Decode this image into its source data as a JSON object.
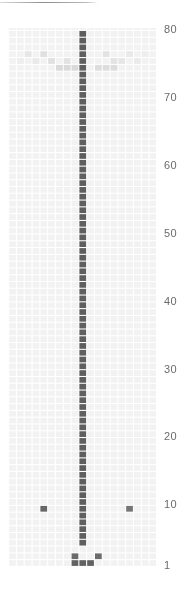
{
  "figure": {
    "top_rule_present": true,
    "background_color": "#ffffff",
    "grid_color": "#f2f2f2",
    "cell_dark_color": "#5f5f5f",
    "cell_mid_color": "#a8a8a8",
    "cell_light_color": "#dcdcdc",
    "axis_label_color": "#6b6b6b"
  },
  "axis": {
    "position": "right",
    "ticks": [
      {
        "label": "80",
        "value": 80,
        "y": 30
      },
      {
        "label": "70",
        "value": 70,
        "y": 98
      },
      {
        "label": "60",
        "value": 60,
        "y": 166
      },
      {
        "label": "50",
        "value": 50,
        "y": 234
      },
      {
        "label": "40",
        "value": 40,
        "y": 302
      },
      {
        "label": "30",
        "value": 30,
        "y": 370
      },
      {
        "label": "20",
        "value": 20,
        "y": 437
      },
      {
        "label": "10",
        "value": 10,
        "y": 505
      },
      {
        "label": "1",
        "value": 1,
        "y": 566
      }
    ]
  },
  "chart_data": {
    "type": "heatmap",
    "title": "",
    "xlabel": "",
    "ylabel": "",
    "grid": true,
    "legend_position": "none",
    "ylim": [
      1,
      80
    ],
    "xlim": [
      0,
      19
    ],
    "x": [
      0,
      1,
      2,
      3,
      4,
      5,
      6,
      7,
      8,
      9,
      10,
      11,
      12,
      13,
      14,
      15,
      16,
      17,
      18
    ],
    "y_ticks": [
      1,
      10,
      20,
      30,
      40,
      50,
      60,
      70,
      80
    ],
    "cell_width": 7.8,
    "cell_height": 6.8,
    "value_scale": {
      "0": "#ffffff",
      "0.25": "#dcdcdc",
      "0.5": "#a8a8a8",
      "1": "#5f5f5f"
    },
    "cells": [
      {
        "col": 9,
        "row": 79,
        "v": 1.0
      },
      {
        "col": 9,
        "row": 78,
        "v": 1.0
      },
      {
        "col": 9,
        "row": 77,
        "v": 1.0
      },
      {
        "col": 9,
        "row": 76,
        "v": 1.0
      },
      {
        "col": 9,
        "row": 75,
        "v": 1.0
      },
      {
        "col": 9,
        "row": 74,
        "v": 1.0
      },
      {
        "col": 9,
        "row": 73,
        "v": 1.0
      },
      {
        "col": 9,
        "row": 72,
        "v": 1.0
      },
      {
        "col": 9,
        "row": 71,
        "v": 1.0
      },
      {
        "col": 9,
        "row": 70,
        "v": 1.0
      },
      {
        "col": 9,
        "row": 69,
        "v": 1.0
      },
      {
        "col": 9,
        "row": 68,
        "v": 1.0
      },
      {
        "col": 9,
        "row": 67,
        "v": 1.0
      },
      {
        "col": 9,
        "row": 66,
        "v": 1.0
      },
      {
        "col": 9,
        "row": 65,
        "v": 1.0
      },
      {
        "col": 9,
        "row": 64,
        "v": 1.0
      },
      {
        "col": 9,
        "row": 63,
        "v": 1.0
      },
      {
        "col": 9,
        "row": 62,
        "v": 1.0
      },
      {
        "col": 9,
        "row": 61,
        "v": 1.0
      },
      {
        "col": 9,
        "row": 60,
        "v": 1.0
      },
      {
        "col": 9,
        "row": 59,
        "v": 1.0
      },
      {
        "col": 9,
        "row": 58,
        "v": 1.0
      },
      {
        "col": 9,
        "row": 57,
        "v": 1.0
      },
      {
        "col": 9,
        "row": 56,
        "v": 1.0
      },
      {
        "col": 9,
        "row": 55,
        "v": 1.0
      },
      {
        "col": 9,
        "row": 54,
        "v": 1.0
      },
      {
        "col": 9,
        "row": 53,
        "v": 1.0
      },
      {
        "col": 9,
        "row": 52,
        "v": 1.0
      },
      {
        "col": 9,
        "row": 51,
        "v": 1.0
      },
      {
        "col": 9,
        "row": 50,
        "v": 1.0
      },
      {
        "col": 9,
        "row": 49,
        "v": 1.0
      },
      {
        "col": 9,
        "row": 48,
        "v": 1.0
      },
      {
        "col": 9,
        "row": 47,
        "v": 1.0
      },
      {
        "col": 9,
        "row": 46,
        "v": 1.0
      },
      {
        "col": 9,
        "row": 45,
        "v": 1.0
      },
      {
        "col": 9,
        "row": 44,
        "v": 1.0
      },
      {
        "col": 9,
        "row": 43,
        "v": 1.0
      },
      {
        "col": 9,
        "row": 42,
        "v": 1.0
      },
      {
        "col": 9,
        "row": 41,
        "v": 1.0
      },
      {
        "col": 9,
        "row": 40,
        "v": 1.0
      },
      {
        "col": 9,
        "row": 39,
        "v": 1.0
      },
      {
        "col": 9,
        "row": 38,
        "v": 1.0
      },
      {
        "col": 9,
        "row": 37,
        "v": 1.0
      },
      {
        "col": 9,
        "row": 36,
        "v": 1.0
      },
      {
        "col": 9,
        "row": 35,
        "v": 1.0
      },
      {
        "col": 9,
        "row": 34,
        "v": 1.0
      },
      {
        "col": 9,
        "row": 33,
        "v": 1.0
      },
      {
        "col": 9,
        "row": 32,
        "v": 1.0
      },
      {
        "col": 9,
        "row": 31,
        "v": 1.0
      },
      {
        "col": 9,
        "row": 30,
        "v": 1.0
      },
      {
        "col": 9,
        "row": 29,
        "v": 1.0
      },
      {
        "col": 9,
        "row": 28,
        "v": 1.0
      },
      {
        "col": 9,
        "row": 27,
        "v": 1.0
      },
      {
        "col": 9,
        "row": 26,
        "v": 1.0
      },
      {
        "col": 9,
        "row": 25,
        "v": 1.0
      },
      {
        "col": 9,
        "row": 24,
        "v": 1.0
      },
      {
        "col": 9,
        "row": 23,
        "v": 1.0
      },
      {
        "col": 9,
        "row": 22,
        "v": 1.0
      },
      {
        "col": 9,
        "row": 21,
        "v": 1.0
      },
      {
        "col": 9,
        "row": 20,
        "v": 1.0
      },
      {
        "col": 9,
        "row": 19,
        "v": 1.0
      },
      {
        "col": 9,
        "row": 18,
        "v": 1.0
      },
      {
        "col": 9,
        "row": 17,
        "v": 1.0
      },
      {
        "col": 9,
        "row": 16,
        "v": 1.0
      },
      {
        "col": 9,
        "row": 15,
        "v": 1.0
      },
      {
        "col": 9,
        "row": 14,
        "v": 1.0
      },
      {
        "col": 9,
        "row": 13,
        "v": 1.0
      },
      {
        "col": 9,
        "row": 12,
        "v": 1.0
      },
      {
        "col": 9,
        "row": 11,
        "v": 1.0
      },
      {
        "col": 9,
        "row": 10,
        "v": 1.0
      },
      {
        "col": 9,
        "row": 9,
        "v": 1.0
      },
      {
        "col": 9,
        "row": 8,
        "v": 1.0
      },
      {
        "col": 9,
        "row": 7,
        "v": 1.0
      },
      {
        "col": 9,
        "row": 6,
        "v": 1.0
      },
      {
        "col": 9,
        "row": 5,
        "v": 1.0
      },
      {
        "col": 9,
        "row": 4,
        "v": 1.0
      },
      {
        "col": 4,
        "row": 9,
        "v": 0.95
      },
      {
        "col": 15,
        "row": 9,
        "v": 0.85
      },
      {
        "col": 8,
        "row": 2,
        "v": 0.92
      },
      {
        "col": 11,
        "row": 2,
        "v": 0.92
      },
      {
        "col": 8,
        "row": 1,
        "v": 0.98
      },
      {
        "col": 9,
        "row": 1,
        "v": 0.98
      },
      {
        "col": 10,
        "row": 1,
        "v": 0.98
      },
      {
        "col": 4,
        "row": 76,
        "v": 0.22
      },
      {
        "col": 5,
        "row": 75,
        "v": 0.22
      },
      {
        "col": 6,
        "row": 74,
        "v": 0.26
      },
      {
        "col": 7,
        "row": 74,
        "v": 0.26
      },
      {
        "col": 8,
        "row": 74,
        "v": 0.26
      },
      {
        "col": 7,
        "row": 75,
        "v": 0.2
      },
      {
        "col": 2,
        "row": 76,
        "v": 0.18
      },
      {
        "col": 3,
        "row": 75,
        "v": 0.16
      },
      {
        "col": 1,
        "row": 75,
        "v": 0.12
      },
      {
        "col": 12,
        "row": 76,
        "v": 0.2
      },
      {
        "col": 13,
        "row": 75,
        "v": 0.2
      },
      {
        "col": 11,
        "row": 74,
        "v": 0.24
      },
      {
        "col": 12,
        "row": 74,
        "v": 0.24
      },
      {
        "col": 13,
        "row": 74,
        "v": 0.24
      },
      {
        "col": 14,
        "row": 75,
        "v": 0.18
      },
      {
        "col": 15,
        "row": 76,
        "v": 0.16
      },
      {
        "col": 16,
        "row": 75,
        "v": 0.14
      },
      {
        "col": 17,
        "row": 76,
        "v": 0.12
      }
    ]
  }
}
